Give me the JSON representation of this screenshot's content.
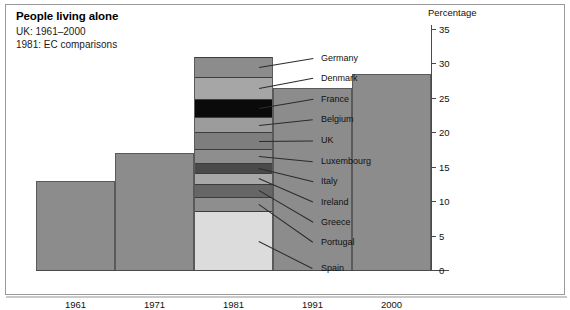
{
  "title": "People living alone",
  "subtitle_line1": "UK: 1961–2000",
  "subtitle_line2": "1981: EC comparisons",
  "axis_caption": "Percentage",
  "chart_data": {
    "type": "bar",
    "title": "People living alone",
    "subtitle": "UK: 1961–2000 / 1981: EC comparisons",
    "xlabel": "",
    "ylabel": "Percentage",
    "ylim": [
      0,
      35
    ],
    "yticks": [
      0,
      5,
      10,
      15,
      20,
      25,
      30,
      35
    ],
    "grid": false,
    "legend": "inline-callouts",
    "categories": [
      "1961",
      "1971",
      "1981",
      "1991",
      "2000"
    ],
    "values": [
      13.0,
      17.0,
      31.0,
      26.5,
      28.5
    ],
    "stacked_category": "1981",
    "stack_note": "1981 bar is subdivided into EC member country comparisons",
    "stack_segments": [
      {
        "name": "Spain",
        "value": 8.5,
        "color": "#dcdcdc"
      },
      {
        "name": "Portugal",
        "value": 2.1,
        "color": "#8e8e8e"
      },
      {
        "name": "Greece",
        "value": 1.9,
        "color": "#666666"
      },
      {
        "name": "Ireland",
        "value": 1.6,
        "color": "#a8a8a8"
      },
      {
        "name": "Italy",
        "value": 1.5,
        "color": "#4a4a4a"
      },
      {
        "name": "Luxembourg",
        "value": 2.0,
        "color": "#8e8e8e"
      },
      {
        "name": "UK",
        "value": 2.4,
        "color": "#7e7e7e"
      },
      {
        "name": "Belgium",
        "value": 2.2,
        "color": "#9c9c9c"
      },
      {
        "name": "France",
        "value": 2.6,
        "color": "#0a0a0a"
      },
      {
        "name": "Denmark",
        "value": 3.2,
        "color": "#a6a6a6"
      },
      {
        "name": "Germany",
        "value": 3.0,
        "color": "#8c8c8c"
      }
    ]
  },
  "colors": {
    "bar_fill": "#8c8c8c",
    "bar_stroke": "#5a5a5a",
    "axis": "#4a4a4a",
    "frame": "#9a9a9a",
    "text": "#111111"
  }
}
